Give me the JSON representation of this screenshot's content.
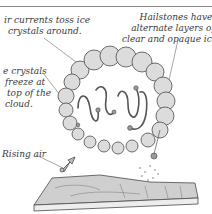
{
  "diagram": {
    "labels": {
      "air_currents": {
        "line1": "ir currents toss ice",
        "line2": "crystals around."
      },
      "hailstones": {
        "line1": "Hailstones have",
        "line2": "alternate layers of",
        "line3": "clear and opaque ice."
      },
      "crystals": {
        "line1": "e crystals",
        "line2": "freeze at",
        "line3": "top of the",
        "line4": "cloud."
      },
      "rising_air": {
        "line1": "Rising air"
      }
    },
    "elements": [
      "storm-cloud",
      "hailstone-paths",
      "rising-air-arrow",
      "falling-hail",
      "ground-terrain"
    ],
    "colors": {
      "line": "#4a4a4a",
      "cloud_shade": "#c8c8c8",
      "ground_shade": "#b5b5b5",
      "background": "#ffffff"
    }
  }
}
